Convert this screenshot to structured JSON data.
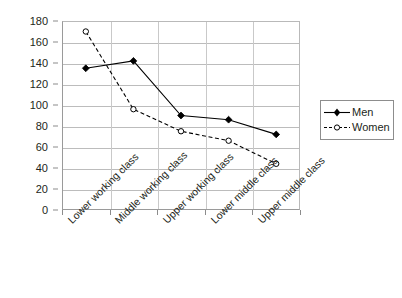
{
  "chart_data": {
    "type": "line",
    "title": "",
    "subtitle": "",
    "xlabel": "",
    "ylabel": "",
    "categories": [
      "Lower working class",
      "Middle working class",
      "Upper working class",
      "Lower middle class",
      "Upper middle class"
    ],
    "series": [
      {
        "name": "Men",
        "values": [
          135,
          142,
          90,
          86,
          72
        ],
        "line_style": "solid",
        "marker": "filled-diamond",
        "color": "#000000"
      },
      {
        "name": "Women",
        "values": [
          170,
          96,
          75,
          66,
          44
        ],
        "line_style": "dashed",
        "marker": "open-circle",
        "color": "#000000"
      }
    ],
    "ylim": [
      0,
      180
    ],
    "y_ticks": [
      0,
      20,
      40,
      60,
      80,
      100,
      120,
      140,
      160,
      180
    ],
    "y_tick_labels": [
      "0",
      "20",
      "40",
      "60",
      "80",
      "100",
      "120",
      "140",
      "160",
      "180"
    ],
    "grid": "horizontal",
    "legend_position": "right",
    "legend_entries": [
      "Men",
      "Women"
    ]
  },
  "legend": {
    "men_label": "Men",
    "women_label": "Women"
  },
  "caption": {
    "text": ""
  }
}
